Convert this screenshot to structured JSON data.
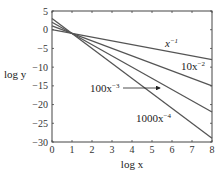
{
  "chart_data": {
    "type": "line",
    "title": "",
    "xlabel": "log x",
    "ylabel": "log y",
    "xlim": [
      0,
      8
    ],
    "ylim": [
      -30,
      5
    ],
    "xticks": [
      0,
      1,
      2,
      3,
      4,
      5,
      6,
      7,
      8
    ],
    "yticks": [
      5,
      0,
      -5,
      -10,
      -15,
      -20,
      -25,
      -30
    ],
    "grid": false,
    "legend": "none (inline curve labels)",
    "x": [
      0,
      8
    ],
    "series": [
      {
        "name": "x^-1",
        "label_base": "x",
        "label_exp": "−1",
        "intercept": 0,
        "slope": -1,
        "values": [
          0,
          -8
        ]
      },
      {
        "name": "10x^-2",
        "label_base": "10x",
        "label_exp": "−2",
        "intercept": 1,
        "slope": -2,
        "values": [
          1,
          -15
        ]
      },
      {
        "name": "100x^-3",
        "label_base": "100x",
        "label_exp": "−3",
        "intercept": 2,
        "slope": -3,
        "values": [
          2,
          -22
        ]
      },
      {
        "name": "1000x^-4",
        "label_base": "1000x",
        "label_exp": "−4",
        "intercept": 3,
        "slope": -4,
        "values": [
          3,
          -29
        ]
      }
    ],
    "annotations": [
      {
        "text": "100x^-3",
        "type": "arrow",
        "points_to_series": "100x^-3"
      }
    ]
  },
  "axes": {
    "xlabel": "log x",
    "ylabel": "log y",
    "xtick_labels": [
      "0",
      "1",
      "2",
      "3",
      "4",
      "5",
      "6",
      "7",
      "8"
    ],
    "ytick_labels": [
      "5",
      "0",
      "−5",
      "−10",
      "−15",
      "−20",
      "−25",
      "−30"
    ]
  },
  "labels": {
    "s1_base": "x",
    "s1_exp": "−1",
    "s2_base": "10x",
    "s2_exp": "−2",
    "s3_base": "100x",
    "s3_exp": "−3",
    "s4_base": "1000x",
    "s4_exp": "−4"
  },
  "colors": {
    "line": "#555555",
    "axis": "#444444"
  }
}
